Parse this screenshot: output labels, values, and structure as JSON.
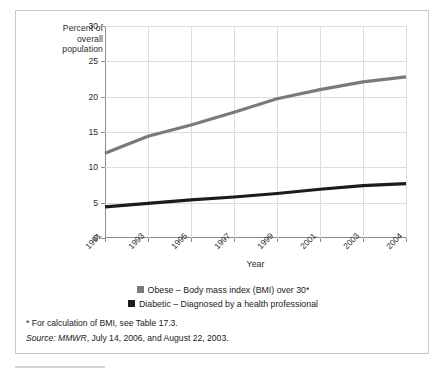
{
  "chart_data": {
    "type": "line",
    "title": "",
    "xlabel": "Year",
    "ylabel": "Percent of overall population",
    "ylabel_lines": [
      "Percent of",
      "overall",
      "population"
    ],
    "x": [
      "1991",
      "1993",
      "1995",
      "1997",
      "1999",
      "2001",
      "2003",
      "2004"
    ],
    "categories": [
      "1991",
      "1993",
      "1995",
      "1997",
      "1999",
      "2001",
      "2003",
      "2004"
    ],
    "yticks": [
      0,
      5,
      10,
      15,
      20,
      25,
      30
    ],
    "ytick_labels": [
      "0",
      "5",
      "10",
      "15",
      "20",
      "25",
      "30"
    ],
    "ylim": [
      0,
      30
    ],
    "grid": true,
    "legend_position": "bottom-center",
    "series": [
      {
        "name": "Obese – Body mass index (BMI) over 30*",
        "short_name": "Obese",
        "color": "#7a7a7a",
        "values": [
          12.0,
          14.4,
          16.0,
          17.8,
          19.7,
          21.0,
          22.1,
          22.8
        ]
      },
      {
        "name": "Diabetic – Diagnosed by a health professional",
        "short_name": "Diabetic",
        "color": "#1c1c1c",
        "values": [
          4.4,
          4.9,
          5.4,
          5.8,
          6.3,
          6.9,
          7.4,
          7.7
        ]
      }
    ]
  },
  "axis": {
    "y_title_lines": [
      "Percent of",
      "overall",
      "population"
    ],
    "x_title": "Year",
    "y_tick_labels": [
      "30",
      "25",
      "20",
      "15",
      "10",
      "5",
      "0"
    ],
    "x_tick_labels": [
      "1991",
      "1993",
      "1995",
      "1997",
      "1999",
      "2001",
      "2003",
      "2004"
    ]
  },
  "legend": {
    "items": [
      {
        "label": "Obese – Body mass index (BMI) over 30*",
        "color": "#7a7a7a"
      },
      {
        "label": "Diabetic – Diagnosed by a health professional",
        "color": "#1c1c1c"
      }
    ]
  },
  "notes": {
    "footnote": "* For calculation of BMI, see Table 17.3.",
    "source_prefix": "Source:",
    "source_publication": "MMWR",
    "source_rest": ", July 14, 2006, and August 22, 2003."
  },
  "colors": {
    "obese": "#7a7a7a",
    "diabetic": "#1c1c1c",
    "grid": "#dcdcdc",
    "axis": "#8c8c8c",
    "frame": "#c9c9c9"
  }
}
